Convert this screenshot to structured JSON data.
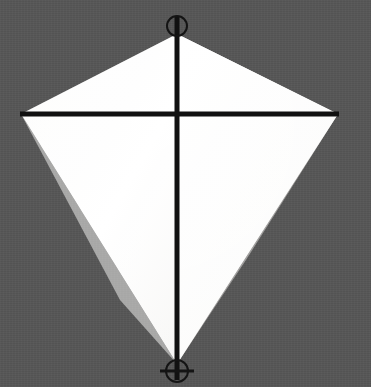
{
  "scene": {
    "title": "Kite",
    "subject_name": "diamond-kite",
    "background_color": "#565656",
    "background_texture": "fine-noise",
    "canvas": {
      "width": 371,
      "height": 387
    }
  },
  "colors": {
    "background": "#565656",
    "sail_light": "#ffffff",
    "sail_shadow": "#f0efee",
    "sail_edge_shadow": "#e6e5e3",
    "spar": "#111111",
    "ring": "#141414"
  },
  "kite": {
    "name": "kite-sail",
    "shape": "rhombus",
    "fill_label": "white",
    "vertices": {
      "top": {
        "x": 177,
        "y": 34
      },
      "left": {
        "x": 21,
        "y": 114
      },
      "right": {
        "x": 338,
        "y": 114
      },
      "bottom": {
        "x": 177,
        "y": 364
      }
    },
    "polygon_points": "177,34 21,114 177,364 338,114"
  },
  "spars": {
    "vertical": {
      "name": "vertical-spar",
      "x": 177,
      "y_start": 16,
      "y_end": 380,
      "thickness": 5
    },
    "horizontal": {
      "name": "horizontal-spar",
      "y": 114,
      "x_start": 20,
      "x_end": 339,
      "thickness": 5
    }
  },
  "markers": [
    {
      "name": "top-ring-marker",
      "type": "ring",
      "cx": 177,
      "cy": 26,
      "r": 10,
      "stroke_width": 2
    },
    {
      "name": "bottom-ring-marker",
      "type": "ring",
      "cx": 177,
      "cy": 371,
      "r": 11,
      "stroke_width": 2
    }
  ],
  "bottom_marker_crossbar": {
    "name": "bottom-crossbar",
    "x_start": 160,
    "x_end": 194,
    "y": 371,
    "thickness": 3
  }
}
